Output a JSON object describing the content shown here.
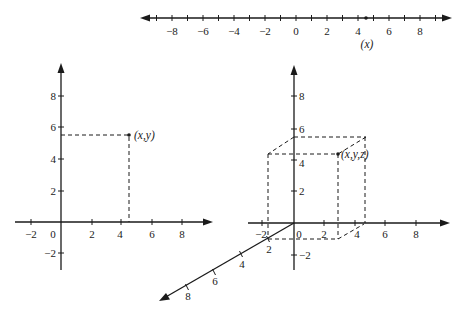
{
  "diagram": {
    "type": "coordinate-systems",
    "panels": [
      {
        "name": "one-dimensional",
        "axis": "number-line",
        "tick_labels": [
          "-8",
          "-6",
          "-4",
          "-2",
          "0",
          "2",
          "4",
          "6",
          "8"
        ],
        "point": {
          "x": 4.6,
          "label": "(x)"
        }
      },
      {
        "name": "two-dimensional",
        "x_tick_labels": [
          "-2",
          "0",
          "2",
          "4",
          "6",
          "8"
        ],
        "y_tick_labels": [
          "8",
          "6",
          "4",
          "2",
          "-2"
        ],
        "point": {
          "x": 4.6,
          "y": 5.5,
          "label": "(x,y)"
        }
      },
      {
        "name": "three-dimensional",
        "x_tick_labels": [
          "-2",
          "0",
          "2",
          "4",
          "6",
          "8"
        ],
        "z_tick_labels": [
          "8",
          "6",
          "4",
          "2",
          "-2"
        ],
        "y_tick_labels": [
          "2",
          "4",
          "6",
          "8"
        ],
        "point": {
          "label": "(x,y,z)"
        }
      }
    ]
  },
  "labels": {
    "line": {
      "m8": "−8",
      "m6": "−6",
      "m4": "−4",
      "m2": "−2",
      "z": "0",
      "p2": "2",
      "p4": "4",
      "p6": "6",
      "p8": "8",
      "point": "(x)"
    },
    "plane": {
      "xm2": "−2",
      "x0": "0",
      "x2": "2",
      "x4": "4",
      "x6": "6",
      "x8": "8",
      "y8": "8",
      "y6": "6",
      "y4": "4",
      "y2": "2",
      "ym2": "−2",
      "point": "(x,y)"
    },
    "space": {
      "xm2": "−2",
      "x0": "0",
      "x2": "2",
      "x4": "4",
      "x6": "6",
      "x8": "8",
      "z8": "8",
      "z6": "6",
      "z4": "4",
      "z2": "2",
      "zm2": "−2",
      "y2": "2",
      "y4": "4",
      "y6": "6",
      "y8": "8",
      "point": "(x,y,z)"
    }
  }
}
